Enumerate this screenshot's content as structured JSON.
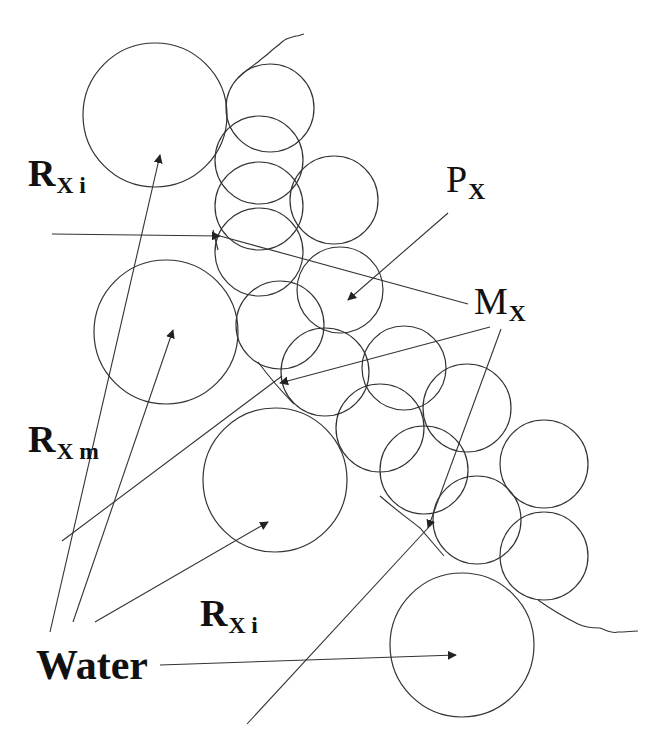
{
  "diagram": {
    "stroke_color": "#333333",
    "background": "#ffffff",
    "labels": {
      "rxi_top": {
        "main": "R",
        "sub": "X i",
        "bold": true
      },
      "px": {
        "main": "P",
        "sub": "X",
        "bold": false
      },
      "mx": {
        "main": "M",
        "sub": "X",
        "bold": false
      },
      "rxm": {
        "main": "R",
        "sub": "X m",
        "bold": true
      },
      "rxi_bottom": {
        "main": "R",
        "sub": "X i",
        "bold": true
      },
      "water": {
        "text": "Water",
        "bold": true
      }
    },
    "large_circles": [
      {
        "id": "water-pore-top-left",
        "cx": 155,
        "cy": 115,
        "r": 72
      },
      {
        "id": "water-pore-left-middle",
        "cx": 166,
        "cy": 332,
        "r": 72
      },
      {
        "id": "water-pore-center",
        "cx": 275,
        "cy": 480,
        "r": 72
      },
      {
        "id": "water-pore-bottom-right",
        "cx": 462,
        "cy": 645,
        "r": 72
      }
    ],
    "small_circles": [
      {
        "cx": 270,
        "cy": 108,
        "r": 44
      },
      {
        "cx": 259,
        "cy": 160,
        "r": 44
      },
      {
        "cx": 259,
        "cy": 206,
        "r": 44
      },
      {
        "cx": 334,
        "cy": 200,
        "r": 44
      },
      {
        "cx": 259,
        "cy": 252,
        "r": 44
      },
      {
        "cx": 340,
        "cy": 290,
        "r": 43
      },
      {
        "cx": 280,
        "cy": 325,
        "r": 44
      },
      {
        "cx": 325,
        "cy": 372,
        "r": 44
      },
      {
        "cx": 404,
        "cy": 368,
        "r": 42
      },
      {
        "cx": 380,
        "cy": 428,
        "r": 44
      },
      {
        "cx": 467,
        "cy": 408,
        "r": 44
      },
      {
        "cx": 424,
        "cy": 470,
        "r": 44
      },
      {
        "cx": 544,
        "cy": 464,
        "r": 44
      },
      {
        "cx": 477,
        "cy": 520,
        "r": 44
      },
      {
        "cx": 544,
        "cy": 556,
        "r": 44
      }
    ]
  }
}
